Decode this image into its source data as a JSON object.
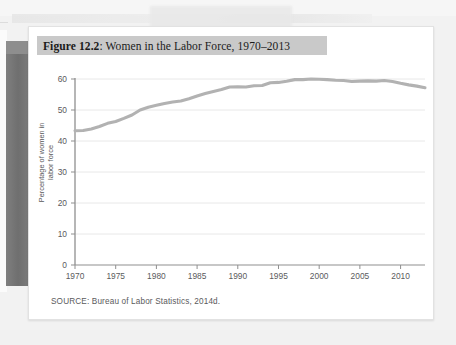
{
  "figure": {
    "label": "Figure 12.2",
    "title_rest": ": Women in the Labor Force, 1970–2013",
    "source": "SOURCE: Bureau of Labor Statistics, 2014d."
  },
  "colors": {
    "title_badge": "#c9c9c9",
    "line": "#b2b2b2",
    "gridline": "#e8e8e8",
    "axis": "#8f8f8f",
    "card": "#ffffff",
    "page_edge": "#757575"
  },
  "chart_data": {
    "type": "line",
    "title": "Figure 12.2: Women in the Labor Force, 1970–2013",
    "xlabel": "",
    "ylabel": "Percentage of women in labor force",
    "xlim": [
      1970,
      2013
    ],
    "ylim": [
      0,
      60
    ],
    "yticks": [
      0,
      10,
      20,
      30,
      40,
      50,
      60
    ],
    "xticks": [
      1970,
      1975,
      1980,
      1985,
      1990,
      1995,
      2000,
      2005,
      2010
    ],
    "grid": true,
    "legend": "none",
    "series": [
      {
        "name": "Percentage of women in labor force",
        "color": "#b2b2b2",
        "x": [
          1970,
          1971,
          1972,
          1973,
          1974,
          1975,
          1976,
          1977,
          1978,
          1979,
          1980,
          1981,
          1982,
          1983,
          1984,
          1985,
          1986,
          1987,
          1988,
          1989,
          1990,
          1991,
          1992,
          1993,
          1994,
          1995,
          1996,
          1997,
          1998,
          1999,
          2000,
          2001,
          2002,
          2003,
          2004,
          2005,
          2006,
          2007,
          2008,
          2009,
          2010,
          2011,
          2012,
          2013
        ],
        "values": [
          43.3,
          43.4,
          43.9,
          44.7,
          45.7,
          46.3,
          47.3,
          48.4,
          50.0,
          50.9,
          51.5,
          52.1,
          52.6,
          52.9,
          53.6,
          54.5,
          55.3,
          56.0,
          56.6,
          57.4,
          57.5,
          57.4,
          57.8,
          57.9,
          58.8,
          58.9,
          59.3,
          59.8,
          59.8,
          60.0,
          59.9,
          59.8,
          59.6,
          59.5,
          59.2,
          59.3,
          59.4,
          59.3,
          59.5,
          59.2,
          58.6,
          58.1,
          57.7,
          57.2
        ]
      }
    ]
  }
}
